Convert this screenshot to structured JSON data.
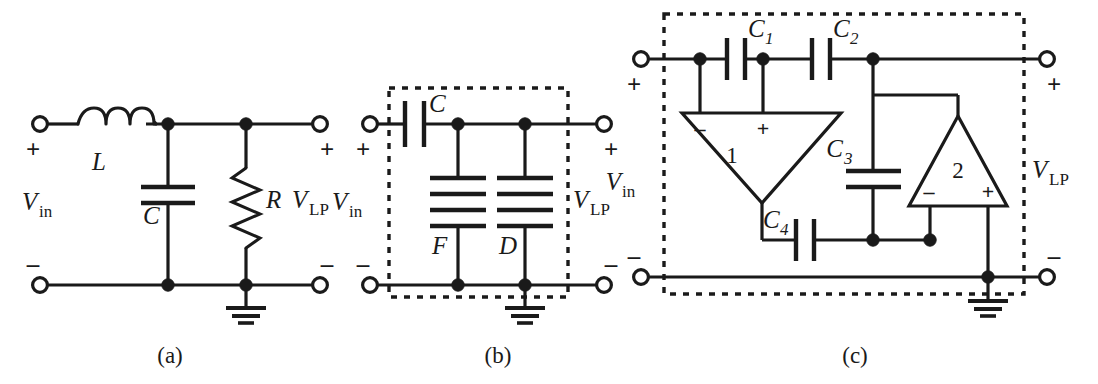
{
  "figure": {
    "background_color": "#ffffff",
    "ink_color": "#1a1a1a"
  },
  "captions": [
    {
      "id": "caption-a",
      "text": "(a)",
      "x": 170,
      "y": 363
    },
    {
      "id": "caption-b",
      "text": "(b)",
      "x": 498,
      "y": 363
    },
    {
      "id": "caption-c",
      "text": "(c)",
      "x": 855,
      "y": 363
    }
  ],
  "circuits": [
    {
      "id": "circuit-a",
      "caption": "(a)",
      "kind": "passive-RLC-lowpass",
      "has_dashed_box": false,
      "port_labels": {
        "input_name": "V",
        "input_sub": "in",
        "output_name": "V",
        "output_sub": "LP",
        "input_plus": "+",
        "input_minus": "–",
        "output_plus": "+",
        "output_minus": "–"
      },
      "components": [
        {
          "ref": "L",
          "type": "inductor",
          "orientation": "series-horizontal",
          "label": "L"
        },
        {
          "ref": "C",
          "type": "capacitor",
          "orientation": "shunt-vertical",
          "label": "C",
          "plates": 2
        },
        {
          "ref": "R",
          "type": "resistor",
          "orientation": "shunt-vertical",
          "label": "R",
          "zigzags": 6
        }
      ],
      "ground": {
        "present": true,
        "bars": 3
      }
    },
    {
      "id": "circuit-b",
      "caption": "(b)",
      "kind": "FDNR-transformed-lowpass",
      "has_dashed_box": true,
      "port_labels": {
        "input_name": "V",
        "input_sub": "in",
        "output_name": "V",
        "output_sub": "LP",
        "input_plus": "+",
        "input_minus": "–",
        "output_plus": "+",
        "output_minus": "–"
      },
      "components": [
        {
          "ref": "C",
          "type": "capacitor",
          "orientation": "series-horizontal",
          "label": "C",
          "plates": 2
        },
        {
          "ref": "F",
          "type": "fdnr",
          "orientation": "shunt-vertical",
          "label": "F",
          "plates": 4
        },
        {
          "ref": "D",
          "type": "fdnr",
          "orientation": "shunt-vertical",
          "label": "D",
          "plates": 4
        }
      ],
      "ground": {
        "present": true,
        "bars": 3
      }
    },
    {
      "id": "circuit-c",
      "caption": "(c)",
      "kind": "active-GIC-FDNR-realization",
      "has_dashed_box": true,
      "port_labels": {
        "input_name": "V",
        "input_sub": "in",
        "output_name": "V",
        "output_sub": "LP",
        "input_plus": "+",
        "input_minus": "–",
        "output_plus": "+",
        "output_minus": "–"
      },
      "components": [
        {
          "ref": "C1",
          "type": "capacitor",
          "label": "C",
          "sub": "1",
          "orientation": "series-horizontal",
          "plates": 2
        },
        {
          "ref": "C2",
          "type": "capacitor",
          "label": "C",
          "sub": "2",
          "orientation": "series-horizontal",
          "plates": 2
        },
        {
          "ref": "C3",
          "type": "capacitor",
          "label": "C",
          "sub": "3",
          "orientation": "shunt-vertical",
          "plates": 2
        },
        {
          "ref": "C4",
          "type": "capacitor",
          "label": "C",
          "sub": "4",
          "orientation": "series-horizontal",
          "plates": 2
        }
      ],
      "opamps": [
        {
          "ref": "A1",
          "number": "1",
          "orientation": "pointing-down",
          "inputs_on": "top-edge",
          "minus_label": "–",
          "plus_label": "+",
          "minus_side": "left",
          "plus_side": "right",
          "output_at": "bottom-apex"
        },
        {
          "ref": "A2",
          "number": "2",
          "orientation": "pointing-up",
          "inputs_on": "bottom-edge",
          "minus_label": "–",
          "plus_label": "+",
          "minus_side": "left",
          "plus_side": "right",
          "output_at": "top-apex"
        }
      ],
      "ground": {
        "present": true,
        "bars": 3
      }
    }
  ]
}
